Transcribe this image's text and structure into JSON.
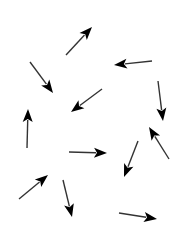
{
  "figure": {
    "width": 188,
    "height": 251,
    "background": "#ffffff",
    "arrow_color": "#000000",
    "shaft_color": "#333333",
    "arrows": [
      {
        "x1": 66,
        "y1": 55,
        "x2": 92,
        "y2": 27
      },
      {
        "x1": 152,
        "y1": 61,
        "x2": 114,
        "y2": 65
      },
      {
        "x1": 30,
        "y1": 62,
        "x2": 53,
        "y2": 93
      },
      {
        "x1": 102,
        "y1": 89,
        "x2": 71,
        "y2": 112
      },
      {
        "x1": 158,
        "y1": 81,
        "x2": 163,
        "y2": 121
      },
      {
        "x1": 27,
        "y1": 148,
        "x2": 28,
        "y2": 109
      },
      {
        "x1": 69,
        "y1": 152,
        "x2": 107,
        "y2": 153
      },
      {
        "x1": 169,
        "y1": 159,
        "x2": 149,
        "y2": 127
      },
      {
        "x1": 138,
        "y1": 141,
        "x2": 124,
        "y2": 177
      },
      {
        "x1": 19,
        "y1": 199,
        "x2": 48,
        "y2": 175
      },
      {
        "x1": 63,
        "y1": 180,
        "x2": 72,
        "y2": 217
      },
      {
        "x1": 119,
        "y1": 213,
        "x2": 157,
        "y2": 219
      }
    ]
  }
}
